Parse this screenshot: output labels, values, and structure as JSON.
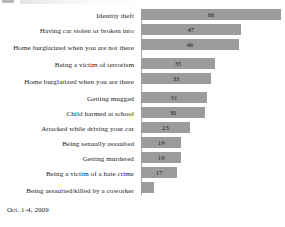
{
  "footer": {
    "date_range": "Oct. 1-4, 2009"
  },
  "chart_data": {
    "type": "bar",
    "orientation": "horizontal",
    "title": "",
    "subtitle": "",
    "xlabel": "",
    "ylabel": "",
    "xlim": [
      0,
      66
    ],
    "grid": false,
    "legend": false,
    "value_label_position": "inside-center",
    "bar_color": "#9c9c9c",
    "axis_color": "#a8a8a8",
    "text_color": "#1c1c1c",
    "source_note": "Oct. 1-4, 2009",
    "categories": [
      "Identity theft",
      "Having car stolen or broken into",
      "Home burglarized when you are not there",
      "Being a victim of terrorism",
      "Home burglarized when you are there",
      "Getting mugged",
      "Child harmed at school",
      "Attacked while driving your car",
      "Being sexually assaulted",
      "Getting murdered",
      "Being a victim of a hate crime",
      "Being assaulted/killed by a coworker"
    ],
    "values": [
      66,
      47,
      46,
      35,
      33,
      31,
      30,
      23,
      19,
      19,
      17,
      6
    ],
    "value_labels": [
      "66",
      "47",
      "46",
      "35",
      "33",
      "31",
      "30",
      "23",
      "19",
      "19",
      "17",
      ""
    ],
    "bars": [
      {
        "label": "Identity theft",
        "value": 66,
        "value_label": "66",
        "show_value": true
      },
      {
        "label": "Having car stolen or broken into",
        "value": 47,
        "value_label": "47",
        "show_value": true
      },
      {
        "label": "Home burglarized when you are not there",
        "value": 46,
        "value_label": "46",
        "show_value": true
      },
      {
        "label": "Being a victim of terrorism",
        "value": 35,
        "value_label": "35",
        "show_value": true
      },
      {
        "label": "Home burglarized when you are there",
        "value": 33,
        "value_label": "33",
        "show_value": true
      },
      {
        "label": "Getting mugged",
        "value": 31,
        "value_label": "31",
        "show_value": true
      },
      {
        "label": "Child harmed at school",
        "value": 30,
        "value_label": "30",
        "show_value": true
      },
      {
        "label": "Attacked while driving your car",
        "value": 23,
        "value_label": "23",
        "show_value": true
      },
      {
        "label": "Being sexually assaulted",
        "value": 19,
        "value_label": "19",
        "show_value": true
      },
      {
        "label": "Getting murdered",
        "value": 19,
        "value_label": "19",
        "show_value": true
      },
      {
        "label": "Being a victim of a hate crime",
        "value": 17,
        "value_label": "17",
        "show_value": true
      },
      {
        "label": "Being assaulted/killed by a coworker",
        "value": 6,
        "value_label": "",
        "show_value": false
      }
    ]
  }
}
